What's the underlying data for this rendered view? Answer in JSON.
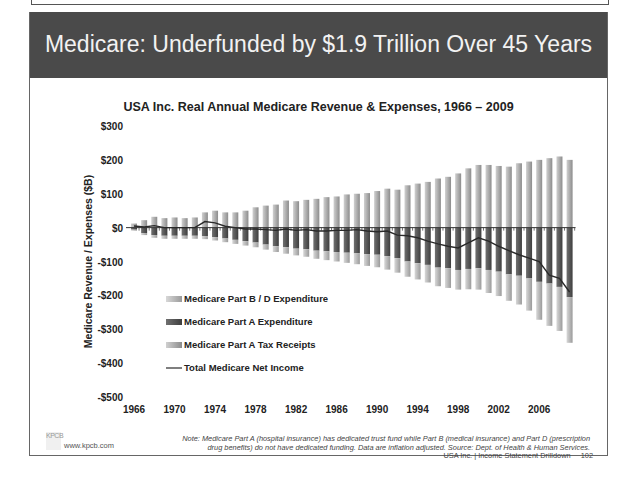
{
  "slide": {
    "header_title": "Medicare: Underfunded by $1.9 Trillion Over 45 Years",
    "chart_title": "USA Inc. Real Annual Medicare Revenue & Expenses, 1966 – 2009",
    "footnote_line1": "Note: Medicare Part A (hospital insurance) has dedicated trust fund while Part B (medical insurance) and Part D (prescription",
    "footnote_line2": "drug benefits) do not have dedicated funding.  Data are inflation adjusted. Source: Dept. of Health & Human Services.",
    "footer_text": "USA Inc. | Income Statement Drilldown",
    "page_number": "102",
    "logo_text": "KPCB",
    "site_url": "www.kpcb.com"
  },
  "colors": {
    "header_bg": "#4a4a4a",
    "part_bd": "#b4b4b4",
    "part_a_exp": "#5a5a5a",
    "part_a_tax": "#a8a8a8",
    "net_line": "#2a2a2a"
  },
  "chart_data": {
    "type": "bar",
    "title": "USA Inc. Real Annual Medicare Revenue & Expenses, 1966 – 2009",
    "xlabel": "",
    "ylabel": "Medicare Revenue / Expenses ($B)",
    "ylim": [
      -500,
      300
    ],
    "yticks": [
      300,
      200,
      100,
      0,
      -100,
      -200,
      -300,
      -400,
      -500
    ],
    "ytick_labels": [
      "$300",
      "$200",
      "$100",
      "$0",
      "-$100",
      "-$200",
      "-$300",
      "-$400",
      "-$500"
    ],
    "xtick_labels": [
      "1966",
      "1970",
      "1974",
      "1978",
      "1982",
      "1986",
      "1990",
      "1994",
      "1998",
      "2002",
      "2006"
    ],
    "grid": false,
    "stacked": true,
    "legend_position": "lower-left inside",
    "categories": [
      1966,
      1967,
      1968,
      1969,
      1970,
      1971,
      1972,
      1973,
      1974,
      1975,
      1976,
      1977,
      1978,
      1979,
      1980,
      1981,
      1982,
      1983,
      1984,
      1985,
      1986,
      1987,
      1988,
      1989,
      1990,
      1991,
      1992,
      1993,
      1994,
      1995,
      1996,
      1997,
      1998,
      1999,
      2000,
      2001,
      2002,
      2003,
      2004,
      2005,
      2006,
      2007,
      2008,
      2009
    ],
    "series": [
      {
        "name": "Medicare Part B / D Expenditure",
        "kind": "bar",
        "values": [
          -3,
          -6,
          -8,
          -9,
          -9,
          -9,
          -9,
          -9,
          -10,
          -11,
          -12,
          -13,
          -14,
          -15,
          -17,
          -19,
          -20,
          -22,
          -24,
          -26,
          -28,
          -30,
          -32,
          -35,
          -37,
          -40,
          -43,
          -45,
          -48,
          -52,
          -55,
          -58,
          -58,
          -60,
          -63,
          -68,
          -72,
          -78,
          -85,
          -95,
          -112,
          -125,
          -130,
          -135
        ]
      },
      {
        "name": "Medicare Part A Expenditure",
        "kind": "bar",
        "values": [
          -6,
          -16,
          -22,
          -24,
          -24,
          -24,
          -24,
          -25,
          -28,
          -32,
          -36,
          -40,
          -44,
          -50,
          -55,
          -58,
          -62,
          -64,
          -68,
          -70,
          -72,
          -74,
          -76,
          -78,
          -80,
          -84,
          -90,
          -100,
          -105,
          -110,
          -118,
          -120,
          -125,
          -122,
          -120,
          -125,
          -130,
          -138,
          -142,
          -150,
          -160,
          -165,
          -175,
          -205
        ]
      },
      {
        "name": "Medicare Part A Tax Receipts",
        "kind": "bar",
        "values": [
          12,
          22,
          32,
          28,
          30,
          28,
          30,
          45,
          50,
          45,
          45,
          50,
          60,
          65,
          68,
          80,
          78,
          82,
          85,
          90,
          92,
          98,
          100,
          102,
          108,
          115,
          112,
          125,
          130,
          135,
          145,
          150,
          160,
          175,
          185,
          185,
          182,
          180,
          190,
          195,
          200,
          205,
          210,
          200
        ]
      },
      {
        "name": "Total Medicare Net Income",
        "kind": "line",
        "values": [
          5,
          2,
          6,
          0,
          0,
          0,
          0,
          18,
          14,
          4,
          0,
          -4,
          -4,
          -6,
          -8,
          -4,
          -8,
          -6,
          -10,
          -10,
          -8,
          -8,
          -6,
          -10,
          -12,
          -10,
          -22,
          -24,
          -30,
          -40,
          -48,
          -55,
          -60,
          -45,
          -30,
          -40,
          -55,
          -68,
          -80,
          -90,
          -100,
          -140,
          -150,
          -190
        ]
      }
    ]
  }
}
